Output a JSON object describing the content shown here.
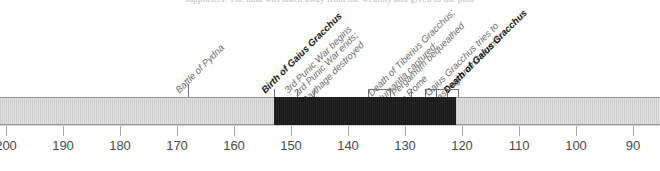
{
  "header": {
    "clipped_text": "supporters. The land was taken away from the wealthy and given to the poor"
  },
  "chart_data": {
    "type": "timeline",
    "xlabel": "",
    "ylabel": "",
    "axis_direction": "BC descending left to right",
    "xlim": [
      200,
      85
    ],
    "grid": false,
    "legend": "none",
    "tick_labels": [
      "200",
      "190",
      "180",
      "170",
      "160",
      "150",
      "140",
      "130",
      "120",
      "110",
      "100",
      "90"
    ],
    "tick_values": [
      200,
      190,
      180,
      170,
      160,
      150,
      140,
      130,
      120,
      110,
      100,
      90
    ],
    "bands": [
      {
        "name": "before-lifetime",
        "start": 200,
        "end": 153,
        "color": "#e3e3e3",
        "style": "hatched-light"
      },
      {
        "name": "lifetime-of-gaius-gracchus",
        "start": 153,
        "end": 121,
        "color": "#191919",
        "style": "solid-dark"
      },
      {
        "name": "after-lifetime",
        "start": 121,
        "end": 85,
        "color": "#e3e3e3",
        "style": "hatched-light"
      }
    ],
    "events": [
      {
        "label": "Battle of Pydna",
        "line2": "",
        "year": 168,
        "emphasis": "normal",
        "marker": "tick"
      },
      {
        "label": "Birth of Gaius Gracchus",
        "line2": "",
        "year": 153,
        "emphasis": "key",
        "marker": "tick"
      },
      {
        "label": "3rd Punic War begins",
        "line2": "",
        "year": 149,
        "emphasis": "normal",
        "marker": "tick"
      },
      {
        "label": "3rd Punic War ends;",
        "line2": "Carthage destroyed",
        "year": 146,
        "emphasis": "normal",
        "marker": "tick"
      },
      {
        "label": "Death of Tiberius Gracchus;",
        "line2": "Numantia captured;",
        "year": 133,
        "emphasis": "normal",
        "marker": "bracket"
      },
      {
        "label": "Pergamum bequeathed",
        "line2": "to Rome",
        "year": 129,
        "emphasis": "normal",
        "marker": "tick"
      },
      {
        "label": "Gaius Gracchus tries to",
        "line2": "pass agrarian reforms",
        "year": 123,
        "emphasis": "normal",
        "marker": "bracket"
      },
      {
        "label": "Death of Gaius Gracchus",
        "line2": "",
        "year": 121,
        "emphasis": "key",
        "marker": "bracket"
      }
    ]
  },
  "colors": {
    "band_light": "#e3e3e3",
    "band_dark": "#191919",
    "axis": "#a8a8a8",
    "tick_text": "#4a4a4a",
    "label_normal": "#6a6a6a",
    "label_key": "#111111"
  }
}
